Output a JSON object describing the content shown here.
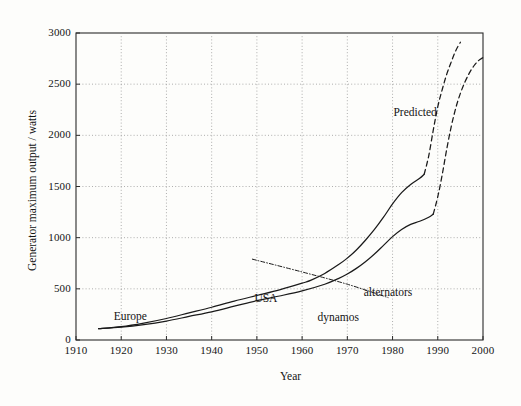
{
  "chart_data": {
    "type": "line",
    "title": "",
    "xlabel": "Year",
    "ylabel": "Generator maximum output / watts",
    "xlim": [
      1910,
      2000
    ],
    "ylim": [
      0,
      3000
    ],
    "grid": true,
    "legend_position": "inline-annotations",
    "xticks": [
      "1910",
      "1920",
      "1930",
      "1940",
      "1950",
      "1960",
      "1970",
      "1980",
      "1990",
      "2000"
    ],
    "yticks": [
      "0",
      "500",
      "1000",
      "1500",
      "2000",
      "2500",
      "3000"
    ],
    "annotations": [
      {
        "text": "Europe",
        "x": 1922,
        "y": 215
      },
      {
        "text": "USA",
        "x": 1952,
        "y": 395
      },
      {
        "text": "dynamos",
        "x": 1968,
        "y": 205
      },
      {
        "text": "alternators",
        "x": 1979,
        "y": 445
      },
      {
        "text": "Predicted",
        "x": 1985,
        "y": 2210
      }
    ],
    "series": [
      {
        "name": "alternators",
        "style": "solid",
        "points": [
          [
            1915,
            110
          ],
          [
            1920,
            130
          ],
          [
            1925,
            165
          ],
          [
            1930,
            210
          ],
          [
            1935,
            265
          ],
          [
            1940,
            320
          ],
          [
            1945,
            380
          ],
          [
            1950,
            435
          ],
          [
            1955,
            490
          ],
          [
            1960,
            555
          ],
          [
            1962,
            585
          ],
          [
            1965,
            650
          ],
          [
            1968,
            735
          ],
          [
            1970,
            800
          ],
          [
            1972,
            880
          ],
          [
            1974,
            975
          ],
          [
            1976,
            1080
          ],
          [
            1978,
            1200
          ],
          [
            1980,
            1330
          ],
          [
            1982,
            1440
          ],
          [
            1984,
            1520
          ],
          [
            1986,
            1580
          ],
          [
            1987,
            1620
          ]
        ]
      },
      {
        "name": "alternators-predicted",
        "style": "dashed",
        "points": [
          [
            1987,
            1620
          ],
          [
            1988,
            1800
          ],
          [
            1989,
            2050
          ],
          [
            1990,
            2280
          ],
          [
            1991,
            2450
          ],
          [
            1992,
            2600
          ],
          [
            1993,
            2720
          ],
          [
            1994,
            2830
          ],
          [
            1995,
            2910
          ]
        ]
      },
      {
        "name": "dynamos",
        "style": "solid",
        "points": [
          [
            1915,
            110
          ],
          [
            1920,
            125
          ],
          [
            1925,
            150
          ],
          [
            1930,
            185
          ],
          [
            1935,
            230
          ],
          [
            1940,
            275
          ],
          [
            1945,
            330
          ],
          [
            1950,
            385
          ],
          [
            1955,
            430
          ],
          [
            1960,
            480
          ],
          [
            1965,
            545
          ],
          [
            1968,
            600
          ],
          [
            1970,
            645
          ],
          [
            1972,
            700
          ],
          [
            1974,
            765
          ],
          [
            1976,
            840
          ],
          [
            1978,
            925
          ],
          [
            1980,
            1010
          ],
          [
            1982,
            1080
          ],
          [
            1984,
            1130
          ],
          [
            1986,
            1160
          ],
          [
            1988,
            1200
          ],
          [
            1989,
            1230
          ]
        ]
      },
      {
        "name": "dynamos-predicted",
        "style": "dashed",
        "points": [
          [
            1989,
            1230
          ],
          [
            1990,
            1400
          ],
          [
            1991,
            1620
          ],
          [
            1992,
            1870
          ],
          [
            1993,
            2090
          ],
          [
            1994,
            2270
          ],
          [
            1995,
            2410
          ],
          [
            1996,
            2520
          ],
          [
            1997,
            2610
          ],
          [
            1998,
            2680
          ],
          [
            1999,
            2730
          ],
          [
            2000,
            2760
          ]
        ]
      },
      {
        "name": "declining-trend",
        "style": "dashdot",
        "points": [
          [
            1949,
            790
          ],
          [
            1960,
            665
          ],
          [
            1970,
            545
          ],
          [
            1979,
            415
          ]
        ]
      }
    ]
  },
  "axes": {
    "y_title": "Generator maximum output / watts",
    "x_title": "Year"
  }
}
